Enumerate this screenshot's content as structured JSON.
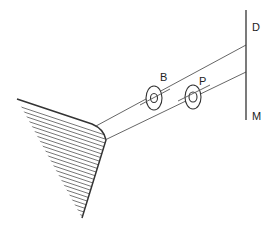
{
  "diagram": {
    "labels": {
      "mirror_top": "D",
      "mirror_bottom": "M",
      "ring_b": "B",
      "ring_p": "P"
    },
    "colors": {
      "stroke": "#333333",
      "hatch": "#555555",
      "background": "#ffffff"
    },
    "elements": [
      "hatched-wedge-source",
      "upper-beam-line",
      "lower-beam-line",
      "ring-B",
      "ring-P",
      "vertical-screen-DM"
    ]
  }
}
